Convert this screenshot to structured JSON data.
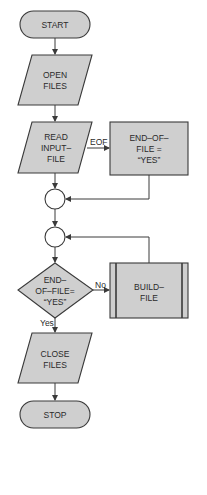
{
  "diagram": {
    "type": "flowchart",
    "colors": {
      "shape_fill": "#cfcfcf",
      "stroke": "#3a3a3a",
      "background": "#ffffff",
      "text": "#2a2a2a"
    },
    "nodes": {
      "start": {
        "shape": "terminal",
        "lines": [
          "START"
        ]
      },
      "open_files": {
        "shape": "io-parallelogram",
        "lines": [
          "OPEN",
          "FILES"
        ]
      },
      "read_input_file": {
        "shape": "io-parallelogram",
        "lines": [
          "READ",
          "INPUT–",
          "FILE"
        ]
      },
      "set_eof": {
        "shape": "process",
        "lines": [
          "END–OF–",
          "FILE =",
          "“YES”"
        ]
      },
      "connector_1": {
        "shape": "connector",
        "lines": []
      },
      "connector_2": {
        "shape": "connector",
        "lines": []
      },
      "eof_decision": {
        "shape": "decision",
        "lines": [
          "END–",
          "OF–FILE=",
          "“YES”"
        ]
      },
      "build_file": {
        "shape": "predefined-process",
        "lines": [
          "BUILD–",
          "FILE"
        ]
      },
      "close_files": {
        "shape": "io-parallelogram",
        "lines": [
          "CLOSE",
          "FILES"
        ]
      },
      "stop": {
        "shape": "terminal",
        "lines": [
          "STOP"
        ]
      }
    },
    "edges": [
      {
        "from": "start",
        "to": "open_files",
        "label": ""
      },
      {
        "from": "open_files",
        "to": "read_input_file",
        "label": ""
      },
      {
        "from": "read_input_file",
        "to": "set_eof",
        "label": "EOF"
      },
      {
        "from": "read_input_file",
        "to": "connector_1",
        "label": ""
      },
      {
        "from": "set_eof",
        "to": "connector_1",
        "label": ""
      },
      {
        "from": "connector_1",
        "to": "connector_2",
        "label": ""
      },
      {
        "from": "connector_2",
        "to": "eof_decision",
        "label": ""
      },
      {
        "from": "eof_decision",
        "to": "build_file",
        "label": "No"
      },
      {
        "from": "build_file",
        "to": "connector_2",
        "label": ""
      },
      {
        "from": "eof_decision",
        "to": "close_files",
        "label": "Yes"
      },
      {
        "from": "close_files",
        "to": "stop",
        "label": ""
      }
    ]
  }
}
